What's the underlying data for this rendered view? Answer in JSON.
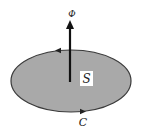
{
  "diagram": {
    "flux_label": "Φ",
    "surface_label": "S",
    "curve_label": "C",
    "colors": {
      "surface_fill": "#a9a9a9",
      "outline": "#3a3a3a",
      "arrow": "#111111",
      "label_box": "#ffffff"
    }
  }
}
